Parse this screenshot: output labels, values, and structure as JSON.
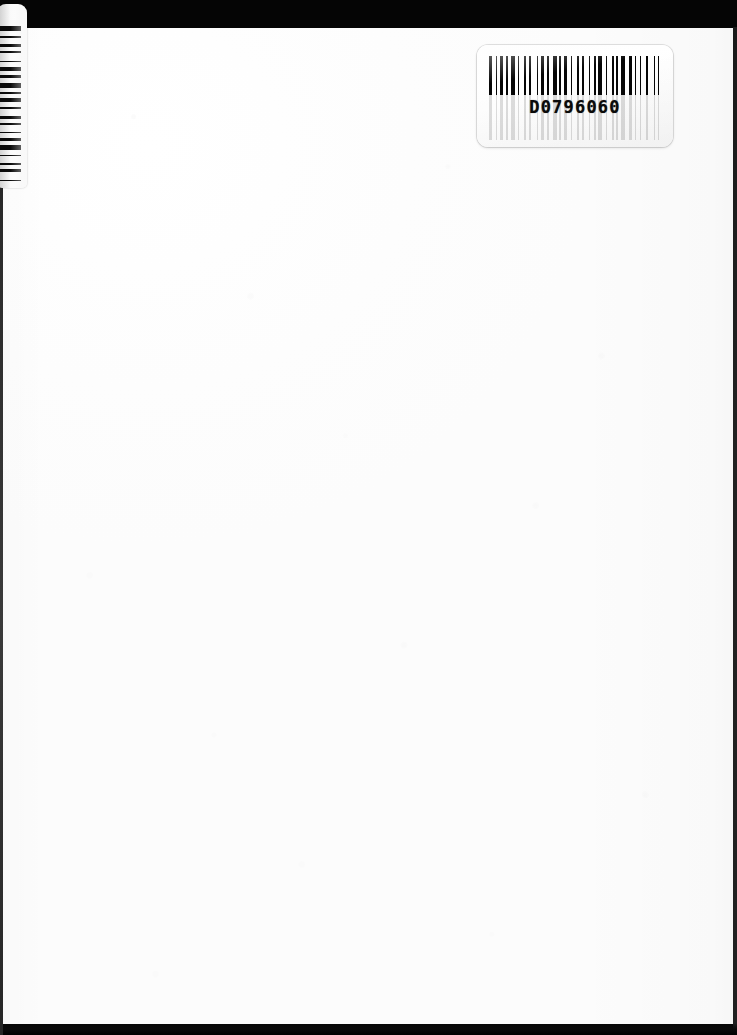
{
  "document": {
    "type": "scanned-page",
    "description": "Blank scanned book page with archival barcode labels",
    "page_side": "recto",
    "page_content_text": ""
  },
  "barcode_label": {
    "name": "main-barcode-label",
    "human_readable_number": "D0796060",
    "symbology": "Code 39",
    "bar_color": "#060606",
    "label_background": "#ffffff",
    "position": "top-right"
  },
  "spine_label": {
    "name": "edge-barcode-label",
    "orientation": "vertical",
    "bar_color": "#0b0b0b",
    "position": "top-left-edge",
    "human_readable_number": ""
  },
  "scan_artifacts": {
    "top_band_color": "#050505",
    "bottom_edge_color": "#000000",
    "left_edge_color": "#0d0d0d",
    "paper_color": "#fdfdfd"
  },
  "colors": {
    "ink": "#060606",
    "paper": "#fdfdfd",
    "shadow": "#000000"
  }
}
